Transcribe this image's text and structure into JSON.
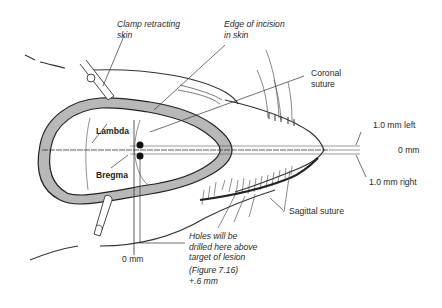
{
  "labels": {
    "clamp": "Clamp retracting\nskin",
    "incision": "Edge of incision\nin skin",
    "coronal": "Coronal\nsuture",
    "lambda": "Lambda",
    "bregma": "Bregma",
    "left": "1.0 mm left",
    "zero_right": "0 mm",
    "right": "1.0 mm right",
    "sagittal": "Sagittal suture",
    "zero_bottom": "0 mm",
    "holes": "Holes will be\ndrilled here above\ntarget of lesion",
    "figure_ref": "(Figure 7.16)\n+.6 mm"
  },
  "colors": {
    "ink": "#222222",
    "bone_fill": "#b8b8b8",
    "line": "#555555"
  }
}
